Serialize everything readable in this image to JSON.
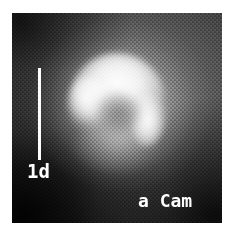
{
  "figure": {
    "caption_object": "a Cam",
    "scale_bar_label": "1d",
    "background_color": "#ffffff",
    "frame_color": "#0a0a0a",
    "annotation_color": "#ffffff"
  },
  "chart_data": {
    "type": "heatmap",
    "title": "a Cam",
    "xlabel": "",
    "ylabel": "",
    "colormap": "grayscale",
    "grid": false,
    "legend_position": "none",
    "annotations": [
      {
        "name": "scale-bar",
        "label": "1d",
        "orientation": "vertical",
        "value": 1,
        "unit": "d",
        "color": "#ffffff"
      },
      {
        "name": "object-label",
        "label": "a Cam",
        "position": "bottom-right",
        "color": "#ffffff"
      }
    ],
    "features": [
      {
        "name": "bright-arc",
        "description": "bright hook/arc shaped emission feature upper centre",
        "center_x": 0.5,
        "center_y": 0.35,
        "peak_intensity": 1.0
      },
      {
        "name": "diffuse-halo",
        "description": "extended diffuse nebulosity surrounding the arc",
        "center_x": 0.52,
        "center_y": 0.44,
        "peak_intensity": 0.55
      },
      {
        "name": "dark-background",
        "description": "dark sky background, darkest toward the corners",
        "peak_intensity": 0.04
      }
    ],
    "intensity_range": [
      0,
      1
    ]
  }
}
